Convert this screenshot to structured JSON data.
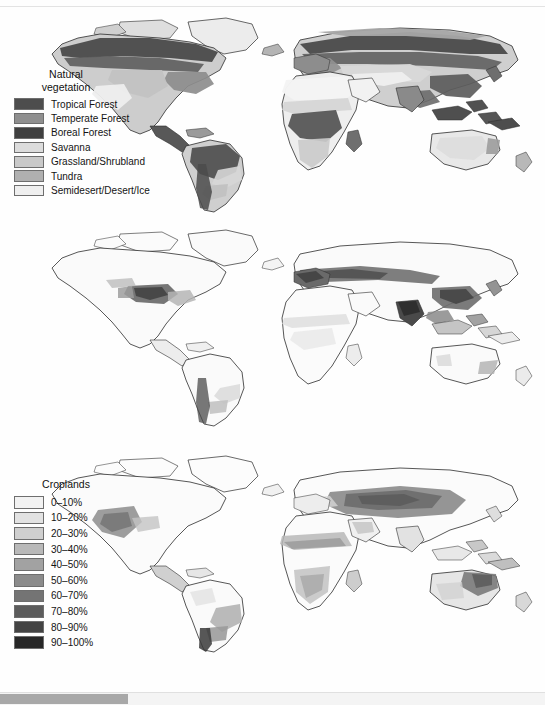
{
  "figure": {
    "background_color": "#fefefe",
    "panel_count": 3
  },
  "panels": [
    {
      "id": "vegetation",
      "legend_title": "Natural\nvegetation",
      "legend_title_line1": "Natural",
      "legend_title_line2": "vegetation",
      "legend_type": "categorical",
      "items": [
        {
          "label": "Tropical Forest",
          "color": "#4d4d4d"
        },
        {
          "label": "Temperate Forest",
          "color": "#8f8f8f"
        },
        {
          "label": "Boreal Forest",
          "color": "#3f3f3f"
        },
        {
          "label": "Savanna",
          "color": "#dcdcdc"
        },
        {
          "label": "Grassland/Shrubland",
          "color": "#c9c9c9"
        },
        {
          "label": "Tundra",
          "color": "#b0b0b0"
        },
        {
          "label": "Semidesert/Desert/Ice",
          "color": "#efefef"
        }
      ]
    },
    {
      "id": "croplands",
      "legend_title": "Croplands",
      "legend_title_line1": "Croplands",
      "legend_title_line2": "",
      "legend_type": "graduated",
      "items": [
        {
          "label": "0–10%",
          "color": "#f2f2f2"
        },
        {
          "label": "10–20%",
          "color": "#e2e2e2"
        },
        {
          "label": "20–30%",
          "color": "#cfcfcf"
        },
        {
          "label": "30–40%",
          "color": "#b9b9b9"
        },
        {
          "label": "40–50%",
          "color": "#a2a2a2"
        },
        {
          "label": "50–60%",
          "color": "#8b8b8b"
        },
        {
          "label": "60–70%",
          "color": "#747474"
        },
        {
          "label": "70–80%",
          "color": "#5c5c5c"
        },
        {
          "label": "80–90%",
          "color": "#434343"
        },
        {
          "label": "90–100%",
          "color": "#272727"
        }
      ]
    },
    {
      "id": "pastures",
      "legend_title": "Pastures and\nrangelands",
      "legend_title_line1": "Pastures and",
      "legend_title_line2": "rangelands",
      "legend_type": "graduated",
      "items": [
        {
          "label": "0–10%",
          "color": "#f5f5f5"
        },
        {
          "label": "10–20%",
          "color": "#fbfbfb"
        },
        {
          "label": "20–30%",
          "color": "#fafafa"
        },
        {
          "label": "30–40%",
          "color": "#ededed"
        },
        {
          "label": "40–50%",
          "color": "#e8e8e8"
        },
        {
          "label": "50–60%",
          "color": "#d9d9d9"
        },
        {
          "label": "60–70%",
          "color": "#9a9a9a"
        },
        {
          "label": "70–80%",
          "color": "#7d7d7d"
        },
        {
          "label": "80–90%",
          "color": "#4f4f4f"
        },
        {
          "label": "90–100%",
          "color": "#1f1f1f"
        }
      ]
    }
  ],
  "chart_data": {
    "type": "heatmap",
    "projection": "world map, two hemispheres side by side",
    "maps": [
      {
        "name": "Natural vegetation",
        "scale": "categorical",
        "classes": [
          "Tropical Forest",
          "Temperate Forest",
          "Boreal Forest",
          "Savanna",
          "Grassland/Shrubland",
          "Tundra",
          "Semidesert/Desert/Ice"
        ],
        "regions": [
          {
            "region": "Amazon Basin",
            "class": "Tropical Forest"
          },
          {
            "region": "Congo Basin",
            "class": "Tropical Forest"
          },
          {
            "region": "Southeast Asia",
            "class": "Tropical Forest"
          },
          {
            "region": "Northern Canada",
            "class": "Boreal Forest"
          },
          {
            "region": "Siberia",
            "class": "Boreal Forest"
          },
          {
            "region": "Eastern United States",
            "class": "Temperate Forest"
          },
          {
            "region": "Western Europe",
            "class": "Temperate Forest"
          },
          {
            "region": "Sahel",
            "class": "Savanna"
          },
          {
            "region": "Central Asia",
            "class": "Grassland/Shrubland"
          },
          {
            "region": "Arctic coast",
            "class": "Tundra"
          },
          {
            "region": "Sahara",
            "class": "Semidesert/Desert/Ice"
          },
          {
            "region": "Arabian Peninsula",
            "class": "Semidesert/Desert/Ice"
          },
          {
            "region": "Greenland",
            "class": "Semidesert/Desert/Ice"
          },
          {
            "region": "Australian interior",
            "class": "Semidesert/Desert/Ice"
          }
        ]
      },
      {
        "name": "Croplands",
        "scale": "percent of grid cell, 0-100 in 10% classes",
        "bins": [
          "0–10%",
          "10–20%",
          "20–30%",
          "30–40%",
          "40–50%",
          "50–60%",
          "60–70%",
          "70–80%",
          "80–90%",
          "90–100%"
        ],
        "regions": [
          {
            "region": "US Midwest / Corn Belt",
            "value": "70–90%"
          },
          {
            "region": "Eastern Europe / Ukraine",
            "value": "70–90%"
          },
          {
            "region": "Northern India / Ganges Plain",
            "value": "80–100%"
          },
          {
            "region": "Eastern China",
            "value": "60–90%"
          },
          {
            "region": "Western Europe",
            "value": "50–80%"
          },
          {
            "region": "Argentine Pampas",
            "value": "30–50%"
          },
          {
            "region": "Sahel cropping belt",
            "value": "10–30%"
          },
          {
            "region": "Amazon Basin",
            "value": "0–10%"
          },
          {
            "region": "Sahara",
            "value": "0–10%"
          },
          {
            "region": "Siberia",
            "value": "0–10%"
          },
          {
            "region": "Australian interior",
            "value": "0–10%"
          }
        ]
      },
      {
        "name": "Pastures and rangelands",
        "scale": "percent of grid cell, 0-100 in 10% classes",
        "bins": [
          "0–10%",
          "10–20%",
          "20–30%",
          "30–40%",
          "40–50%",
          "50–60%",
          "60–70%",
          "70–80%",
          "80–90%",
          "90–100%"
        ],
        "regions": [
          {
            "region": "Central Asian steppe",
            "value": "60–90%"
          },
          {
            "region": "Western United States",
            "value": "50–80%"
          },
          {
            "region": "Sahel",
            "value": "40–70%"
          },
          {
            "region": "Southern Africa",
            "value": "40–70%"
          },
          {
            "region": "Australian rangelands",
            "value": "50–80%"
          },
          {
            "region": "Brazilian Cerrado / southern Brazil",
            "value": "40–70%"
          },
          {
            "region": "Patagonia",
            "value": "60–90%"
          },
          {
            "region": "Amazon Basin",
            "value": "0–20%"
          },
          {
            "region": "Sahara",
            "value": "0–10%"
          },
          {
            "region": "Siberia",
            "value": "0–10%"
          },
          {
            "region": "Greenland",
            "value": "0–10%"
          }
        ]
      }
    ]
  },
  "scrollbar": {
    "orientation": "horizontal",
    "thumb_color": "#a8a8a8",
    "track_color": "#f4f4f4",
    "thumb_position": "left"
  }
}
